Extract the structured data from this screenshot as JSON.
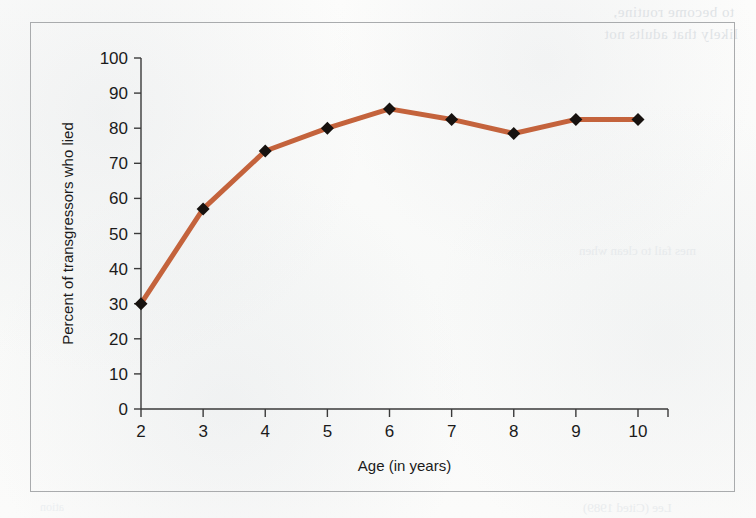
{
  "figure": {
    "frame_color": "#a9abad",
    "background_color": "#fbfbfa"
  },
  "showthrough_text": {
    "line1": "to become routine,",
    "line2": "likely that adults not",
    "line3": "mes fail to clean when",
    "line4": "Lee (Cited 1989)",
    "line5": "ation"
  },
  "chart_data": {
    "type": "line",
    "title": "",
    "xlabel": "Age (in years)",
    "ylabel": "Percent of transgressors who lied",
    "categories": [
      2,
      3,
      4,
      5,
      6,
      7,
      8,
      9,
      10
    ],
    "x": [
      2,
      3,
      4,
      5,
      6,
      7,
      8,
      9,
      10
    ],
    "values": [
      30,
      57,
      73.5,
      80,
      85.5,
      82.5,
      78.5,
      82.5,
      82.5
    ],
    "series": [
      {
        "name": "Percent of transgressors who lied",
        "values": [
          30,
          57,
          73.5,
          80,
          85.5,
          82.5,
          78.5,
          82.5,
          82.5
        ]
      }
    ],
    "xlim": [
      2,
      10
    ],
    "ylim": [
      0,
      100
    ],
    "ytick_labels": [
      "0",
      "10",
      "20",
      "30",
      "40",
      "50",
      "60",
      "70",
      "80",
      "90",
      "100"
    ],
    "ytick_values": [
      0,
      10,
      20,
      30,
      40,
      50,
      60,
      70,
      80,
      90,
      100
    ],
    "xtick_labels": [
      "2",
      "3",
      "4",
      "5",
      "6",
      "7",
      "8",
      "9",
      "10"
    ],
    "grid": false,
    "legend": false,
    "legend_position": "none",
    "line_color": "#c4633c",
    "line_width": 5,
    "marker": "diamond",
    "marker_color": "#17120f",
    "marker_size": 13,
    "axis_color": "#3a3a3a"
  }
}
